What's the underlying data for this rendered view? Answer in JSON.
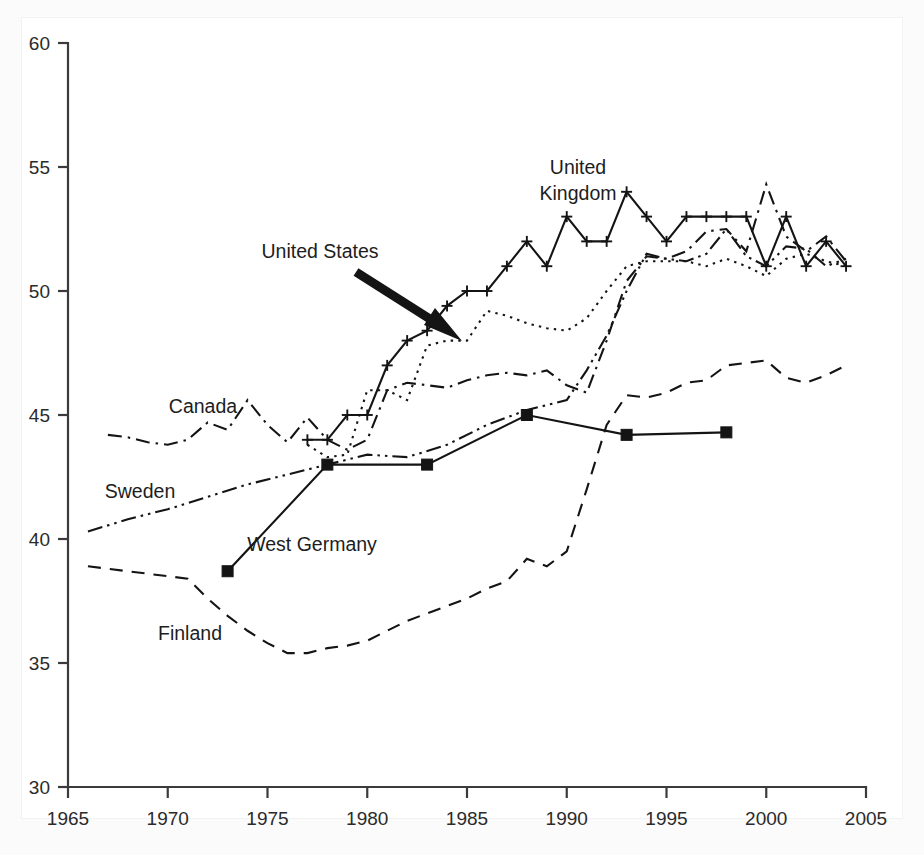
{
  "figure": {
    "background": "#fbfbfb",
    "plot_background": "#ffffff",
    "ink_color": "#141414"
  },
  "chart_data": {
    "type": "line",
    "title": "",
    "subtitle": "",
    "xlabel": "",
    "ylabel": "",
    "xlim": [
      1965,
      2005
    ],
    "ylim": [
      30,
      60
    ],
    "xticks": [
      1965,
      1970,
      1975,
      1980,
      1985,
      1990,
      1995,
      2000,
      2005
    ],
    "yticks": [
      30,
      35,
      40,
      45,
      50,
      55,
      60
    ],
    "xtick_labels": [
      "1965",
      "1970",
      "1975",
      "1980",
      "1985",
      "1990",
      "1995",
      "2000",
      "2005"
    ],
    "ytick_labels": [
      "30",
      "35",
      "40",
      "45",
      "50",
      "55",
      "60"
    ],
    "grid": false,
    "legend_position": "inline-annotations",
    "series": [
      {
        "name": "United Kingdom",
        "line_style": "solid",
        "marker": "plus",
        "x": [
          1977,
          1978,
          1979,
          1980,
          1981,
          1982,
          1983,
          1984,
          1985,
          1986,
          1987,
          1988,
          1989,
          1990,
          1991,
          1992,
          1993,
          1994,
          1995,
          1996,
          1997,
          1998,
          1999,
          2000,
          2001,
          2002,
          2003,
          2004
        ],
        "values": [
          44.0,
          44.0,
          45.0,
          45.0,
          47.0,
          48.0,
          48.4,
          49.4,
          50.0,
          50.0,
          51.0,
          52.0,
          51.0,
          53.0,
          52.0,
          52.0,
          54.0,
          53.0,
          52.0,
          53.0,
          53.0,
          53.0,
          53.0,
          51.0,
          53.0,
          51.0,
          52.0,
          51.0
        ]
      },
      {
        "name": "United States",
        "line_style": "dotted",
        "marker": "none",
        "x": [
          1977,
          1978,
          1979,
          1980,
          1981,
          1982,
          1983,
          1984,
          1985,
          1986,
          1987,
          1988,
          1989,
          1990,
          1991,
          1992,
          1993,
          1994,
          1995,
          1996,
          1997,
          1998,
          1999,
          2000,
          2001,
          2002,
          2003,
          2004
        ],
        "values": [
          43.8,
          43.3,
          43.4,
          46.0,
          46.0,
          45.6,
          47.8,
          48.0,
          48.0,
          49.2,
          49.0,
          48.7,
          48.5,
          48.4,
          48.9,
          50.0,
          51.0,
          51.2,
          51.2,
          51.2,
          51.0,
          51.3,
          51.0,
          50.6,
          51.3,
          51.5,
          51.2,
          51.0
        ]
      },
      {
        "name": "Canada",
        "line_style": "dashdot",
        "marker": "none",
        "x": [
          1967,
          1968,
          1969,
          1970,
          1971,
          1972,
          1973,
          1974,
          1975,
          1976,
          1977,
          1978,
          1979,
          1980,
          1981,
          1982,
          1983,
          1984,
          1985,
          1986,
          1987,
          1988,
          1989,
          1990,
          1991,
          1992,
          1993,
          1994,
          1995,
          1996,
          1997,
          1998,
          1999,
          2000,
          2001,
          2002,
          2003,
          2004
        ],
        "values": [
          44.2,
          44.1,
          43.9,
          43.8,
          44.0,
          44.7,
          44.4,
          45.6,
          44.6,
          43.9,
          44.9,
          44.0,
          43.6,
          44.0,
          46.0,
          46.3,
          46.2,
          46.1,
          46.4,
          46.6,
          46.7,
          46.6,
          46.8,
          46.2,
          45.9,
          48.0,
          50.4,
          51.4,
          51.3,
          51.6,
          52.4,
          52.5,
          51.6,
          54.3,
          52.2,
          51.6,
          52.2,
          51.2
        ]
      },
      {
        "name": "Sweden",
        "line_style": "dashdotdot",
        "marker": "none",
        "x": [
          1966,
          1968,
          1970,
          1972,
          1974,
          1976,
          1978,
          1980,
          1982,
          1984,
          1986,
          1988,
          1990,
          1991,
          1992,
          1993,
          1994,
          1995,
          1996,
          1997,
          1998,
          1999,
          2000,
          2001,
          2002,
          2003,
          2004
        ],
        "values": [
          40.3,
          40.8,
          41.2,
          41.7,
          42.2,
          42.6,
          43.0,
          43.4,
          43.3,
          43.8,
          44.6,
          45.2,
          45.6,
          46.8,
          48.2,
          50.0,
          51.5,
          51.3,
          51.2,
          51.5,
          52.5,
          51.4,
          51.0,
          51.8,
          51.7,
          51.0,
          51.3
        ]
      },
      {
        "name": "West Germany",
        "line_style": "solid",
        "marker": "square",
        "x": [
          1973,
          1978,
          1983,
          1988,
          1993,
          1998
        ],
        "values": [
          38.7,
          43.0,
          43.0,
          45.0,
          44.2,
          44.3
        ]
      },
      {
        "name": "Finland",
        "line_style": "dashed",
        "marker": "none",
        "x": [
          1966,
          1968,
          1970,
          1971,
          1972,
          1973,
          1974,
          1975,
          1976,
          1977,
          1978,
          1979,
          1980,
          1981,
          1982,
          1983,
          1984,
          1985,
          1986,
          1987,
          1988,
          1989,
          1990,
          1991,
          1992,
          1993,
          1994,
          1995,
          1996,
          1997,
          1998,
          1999,
          2000,
          2001,
          2002,
          2003,
          2004
        ],
        "values": [
          38.9,
          38.7,
          38.5,
          38.4,
          37.6,
          36.9,
          36.3,
          35.8,
          35.4,
          35.4,
          35.6,
          35.7,
          35.9,
          36.3,
          36.7,
          37.0,
          37.3,
          37.6,
          38.0,
          38.3,
          39.2,
          38.9,
          39.5,
          42.0,
          44.6,
          45.8,
          45.7,
          45.9,
          46.3,
          46.4,
          47.0,
          47.1,
          47.2,
          46.5,
          46.3,
          46.6,
          47.0
        ]
      }
    ],
    "annotations": [
      {
        "label": "United Kingdom",
        "kind": "series-label",
        "lines": [
          "United",
          "Kingdom"
        ]
      },
      {
        "label": "United States",
        "kind": "series-label-with-arrow"
      },
      {
        "label": "Canada",
        "kind": "series-label"
      },
      {
        "label": "Sweden",
        "kind": "series-label"
      },
      {
        "label": "West Germany",
        "kind": "series-label"
      },
      {
        "label": "Finland",
        "kind": "series-label"
      }
    ]
  },
  "labels": {
    "united_kingdom_line1": "United",
    "united_kingdom_line2": "Kingdom",
    "united_states": "United States",
    "canada": "Canada",
    "sweden": "Sweden",
    "west_germany": "West Germany",
    "finland": "Finland"
  }
}
